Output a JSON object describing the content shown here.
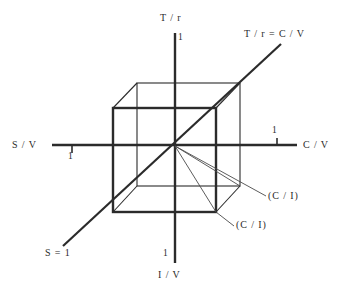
{
  "figure": {
    "axes": [
      {
        "id": "t-over-r",
        "label": "T / r",
        "tick": "1",
        "orientation": "vertical-up"
      },
      {
        "id": "i-over-v",
        "label": "I / V",
        "tick": "1",
        "orientation": "vertical-down"
      },
      {
        "id": "c-over-v",
        "label": "C / V",
        "tick": "1",
        "orientation": "horizontal-right"
      },
      {
        "id": "s-over-v",
        "label": "S / V",
        "tick": "1",
        "orientation": "horizontal-left"
      },
      {
        "id": "t-over-r-eq-c-over-v",
        "label": "T / r = C / V",
        "tick": "",
        "orientation": "diagonal-up-right"
      },
      {
        "id": "s-equals-1",
        "label": "S = 1",
        "tick": "",
        "orientation": "diagonal-down-left"
      }
    ],
    "annotations": [
      {
        "id": "c-over-i-upper",
        "label": "(C / I)"
      },
      {
        "id": "c-over-i-lower",
        "label": "(C / I)"
      }
    ],
    "colors": {
      "line": "#2b2b2b",
      "background": "#ffffff"
    }
  }
}
